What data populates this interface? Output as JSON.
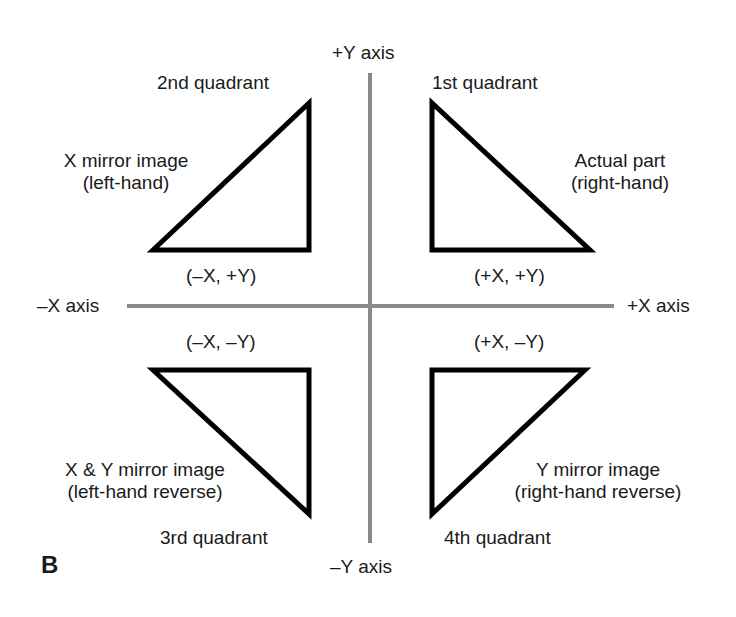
{
  "figure": {
    "panel_label": "B",
    "axes": {
      "plus_y": "+Y axis",
      "minus_y": "–Y axis",
      "plus_x": "+X axis",
      "minus_x": "–X axis",
      "color": "#8a8a8a"
    },
    "quadrants": [
      {
        "name": "1st quadrant",
        "coords": "(+X, +Y)",
        "desc_line1": "Actual part",
        "desc_line2": "(right-hand)"
      },
      {
        "name": "2nd quadrant",
        "coords": "(–X, +Y)",
        "desc_line1": "X mirror image",
        "desc_line2": "(left-hand)"
      },
      {
        "name": "3rd quadrant",
        "coords": "(–X, –Y)",
        "desc_line1": "X & Y mirror image",
        "desc_line2": "(left-hand reverse)"
      },
      {
        "name": "4th quadrant",
        "coords": "(+X, –Y)",
        "desc_line1": "Y mirror image",
        "desc_line2": "(right-hand reverse)"
      }
    ],
    "triangle_stroke": "#000000"
  }
}
